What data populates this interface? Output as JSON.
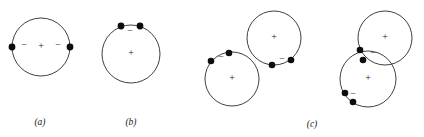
{
  "figure": {
    "width": 424,
    "height": 137,
    "background_color": "#ffffff",
    "stroke_color": "#2a2a2a",
    "electron_color": "#0d0d0d",
    "text_color": "#1a1a1a"
  },
  "panels": [
    {
      "key": "a",
      "label": "(a)",
      "label_x": 40,
      "label_y": 123,
      "atoms": [
        {
          "name": "atom-a-1",
          "cx": 41,
          "cy": 47,
          "r": 29,
          "nucleus": {
            "symbol": "+",
            "x": 41,
            "y": 47
          },
          "electrons": [
            {
              "name": "electron-left",
              "x": 12,
              "y": 47,
              "r": 3.4,
              "charge": "−",
              "charge_x": 24,
              "charge_y": 46
            },
            {
              "name": "electron-right",
              "x": 70,
              "y": 47,
              "r": 3.4,
              "charge": "−",
              "charge_x": 58,
              "charge_y": 46
            }
          ]
        }
      ]
    },
    {
      "key": "b",
      "label": "(b)",
      "label_x": 131,
      "label_y": 123,
      "atoms": [
        {
          "name": "atom-b-1",
          "cx": 131,
          "cy": 54,
          "r": 29,
          "nucleus": {
            "symbol": "+",
            "x": 131,
            "y": 54
          },
          "electrons": [
            {
              "name": "electron-upper-left",
              "x": 121,
              "y": 26,
              "r": 3.4,
              "charge": "",
              "charge_x": 0,
              "charge_y": 0
            },
            {
              "name": "electron-upper-right",
              "x": 140,
              "y": 26,
              "r": 3.4,
              "charge": "−",
              "charge_x": 130,
              "charge_y": 32
            }
          ]
        }
      ]
    },
    {
      "key": "c",
      "label": "(c)",
      "label_x": 312,
      "label_y": 125,
      "atoms": [
        {
          "name": "atom-c-1-lower-left",
          "cx": 232,
          "cy": 79,
          "r": 27,
          "nucleus": {
            "symbol": "+",
            "x": 232,
            "y": 79
          },
          "electrons": [
            {
              "name": "electron-upper-left",
              "x": 211,
              "y": 61,
              "r": 3.3,
              "charge": "",
              "charge_x": 0,
              "charge_y": 0
            },
            {
              "name": "electron-upper-right",
              "x": 229,
              "y": 53,
              "r": 3.3,
              "charge": "−",
              "charge_x": 221,
              "charge_y": 58
            }
          ]
        },
        {
          "name": "atom-c-2-upper-right",
          "cx": 274,
          "cy": 38,
          "r": 27,
          "nucleus": {
            "symbol": "+",
            "x": 274,
            "y": 38
          },
          "electrons": [
            {
              "name": "electron-lower-left",
              "x": 272,
              "y": 65,
              "r": 3.3,
              "charge": "",
              "charge_x": 0,
              "charge_y": 0
            },
            {
              "name": "electron-lower-right",
              "x": 291,
              "y": 60,
              "r": 3.3,
              "charge": "−",
              "charge_x": 282,
              "charge_y": 60
            }
          ]
        },
        {
          "name": "atom-c-3-lower-left",
          "cx": 368,
          "cy": 79,
          "r": 28,
          "nucleus": {
            "symbol": "+",
            "x": 368,
            "y": 79
          },
          "electrons": [
            {
              "name": "electron-lower-left-outer",
              "x": 345,
              "y": 93,
              "r": 3.3,
              "charge": "",
              "charge_x": 0,
              "charge_y": 0
            },
            {
              "name": "electron-lower-left-inner",
              "x": 353,
              "y": 102,
              "r": 3.3,
              "charge": "−",
              "charge_x": 353,
              "charge_y": 95
            }
          ]
        },
        {
          "name": "atom-c-4-upper-right",
          "cx": 385,
          "cy": 38,
          "r": 27,
          "nucleus": {
            "symbol": "+",
            "x": 385,
            "y": 38
          },
          "electrons": [
            {
              "name": "electron-left-upper",
              "x": 360,
              "y": 50,
              "r": 3.3,
              "charge": "",
              "charge_x": 0,
              "charge_y": 0
            },
            {
              "name": "electron-left-lower",
              "x": 363,
              "y": 60,
              "r": 3.3,
              "charge": "−",
              "charge_x": 373,
              "charge_y": 54
            }
          ]
        }
      ]
    }
  ]
}
